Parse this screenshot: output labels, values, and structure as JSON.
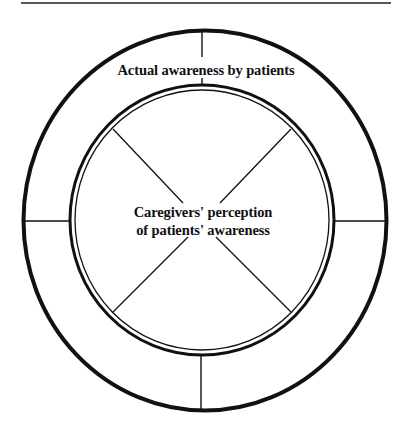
{
  "diagram": {
    "type": "concentric-circle-model",
    "colors": {
      "stroke": "#111111",
      "background": "#ffffff"
    },
    "outer_ring": {
      "label": "Actual awareness by patients",
      "segments": 4,
      "divider_positions": [
        "top",
        "right",
        "bottom",
        "left"
      ]
    },
    "inner_circle": {
      "label_line1": "Caregivers' perception",
      "label_line2": "of patients' awareness",
      "segments": 4,
      "divider_positions": [
        "top-left",
        "top-right",
        "bottom-right",
        "bottom-left"
      ]
    }
  }
}
